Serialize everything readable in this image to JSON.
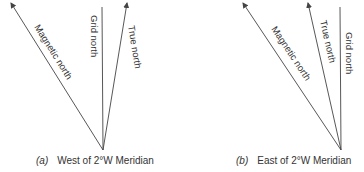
{
  "figure": {
    "panels": [
      {
        "id": "a",
        "caption_label": "(a)",
        "caption_text": "West of 2°W Meridian",
        "lines": [
          {
            "name": "Magnetic north",
            "arrow": true
          },
          {
            "name": "Grid north",
            "arrow": false
          },
          {
            "name": "True north",
            "arrow": true
          }
        ]
      },
      {
        "id": "b",
        "caption_label": "(b)",
        "caption_text": "East of 2°W Meridian",
        "lines": [
          {
            "name": "Magnetic north",
            "arrow": true
          },
          {
            "name": "True north",
            "arrow": true
          },
          {
            "name": "Grid north",
            "arrow": false
          }
        ]
      }
    ],
    "line_color": "#444444",
    "text_color": "#333333"
  }
}
